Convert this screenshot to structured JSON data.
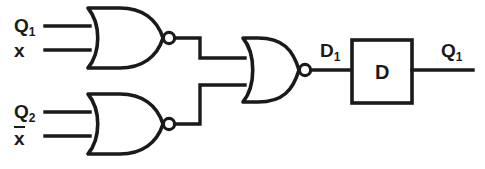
{
  "figure": {
    "name": "sequential-logic-circuit",
    "background_color": "#ffffff",
    "line_color": "#1a1a1a",
    "width": 485,
    "height": 169
  },
  "inputs": [
    {
      "id": "in-q1",
      "label": "Q",
      "subscript": "1",
      "overbar": false,
      "gate": "nor-gate-top",
      "pin": "upper"
    },
    {
      "id": "in-x",
      "label": "x",
      "subscript": "",
      "overbar": false,
      "gate": "nor-gate-top",
      "pin": "lower"
    },
    {
      "id": "in-q2",
      "label": "Q",
      "subscript": "2",
      "overbar": false,
      "gate": "nor-gate-bottom",
      "pin": "upper"
    },
    {
      "id": "in-xbar",
      "label": "x",
      "subscript": "",
      "overbar": true,
      "gate": "nor-gate-bottom",
      "pin": "lower"
    }
  ],
  "gates": [
    {
      "id": "nor-gate-top",
      "type": "NOR",
      "inputs": [
        "Q1",
        "x"
      ],
      "output": "top-nor-out"
    },
    {
      "id": "nor-gate-bottom",
      "type": "NOR",
      "inputs": [
        "Q2",
        "xbar"
      ],
      "output": "bottom-nor-out"
    },
    {
      "id": "nor-gate-output",
      "type": "NOR",
      "inputs": [
        "top-nor-out",
        "bottom-nor-out"
      ],
      "output": "D1"
    }
  ],
  "flipflop": {
    "id": "d-flip-flop",
    "box_letter": "D",
    "input_label": "D",
    "input_subscript": "1",
    "output_label": "Q",
    "output_subscript": "1"
  },
  "signals": {
    "d1": {
      "label": "D",
      "subscript": "1"
    },
    "q1_out": {
      "label": "Q",
      "subscript": "1"
    }
  }
}
